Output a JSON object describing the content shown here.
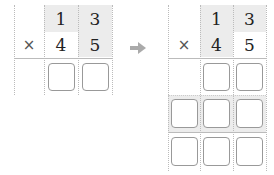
{
  "left": {
    "multiplicand": [
      "1",
      "3"
    ],
    "multiplier": [
      "4",
      "5"
    ],
    "operator": "×",
    "answer_boxes": 2
  },
  "arrow": "right-arrow",
  "right": {
    "multiplicand": [
      "1",
      "3"
    ],
    "multiplier": [
      "4",
      "5"
    ],
    "operator": "×",
    "answer_rows": [
      2,
      3,
      3
    ]
  },
  "colors": {
    "shade": "#ececec",
    "box_border": "#999999",
    "arrow": "#aaaaaa"
  }
}
